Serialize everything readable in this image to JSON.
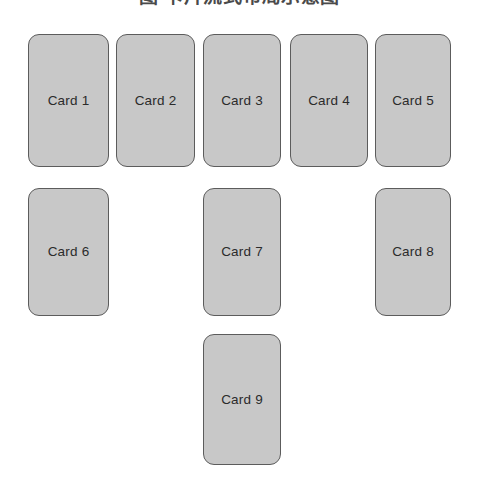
{
  "page": {
    "width": 479,
    "height": 495,
    "background_color": "#ffffff"
  },
  "heading": {
    "text": "图 卡片流式布局示意图",
    "clipped": true,
    "color": "#4a4a4a"
  },
  "style": {
    "card_fill": "#c8c8c8",
    "card_border": "#5c5c5c",
    "card_text": "#2b2b2b",
    "corner_radius_px": 11
  },
  "grid": {
    "columns": 5,
    "rows": 3,
    "card_width": 81,
    "card_height": 133,
    "column_x": [
      28,
      116,
      203,
      290,
      375
    ],
    "row_y": [
      34,
      188,
      334
    ],
    "row_heights": [
      133,
      128,
      131
    ]
  },
  "cards": [
    {
      "label": "Card 1",
      "row": 0,
      "col": 0,
      "x": 28,
      "y": 34,
      "w": 81,
      "h": 133
    },
    {
      "label": "Card 2",
      "row": 0,
      "col": 1,
      "x": 116,
      "y": 34,
      "w": 79,
      "h": 133
    },
    {
      "label": "Card 3",
      "row": 0,
      "col": 2,
      "x": 203,
      "y": 34,
      "w": 78,
      "h": 133
    },
    {
      "label": "Card 4",
      "row": 0,
      "col": 3,
      "x": 290,
      "y": 34,
      "w": 78,
      "h": 133
    },
    {
      "label": "Card 5",
      "row": 0,
      "col": 4,
      "x": 375,
      "y": 34,
      "w": 76,
      "h": 133
    },
    {
      "label": "Card 6",
      "row": 1,
      "col": 0,
      "x": 28,
      "y": 188,
      "w": 81,
      "h": 128
    },
    {
      "label": "Card 7",
      "row": 1,
      "col": 2,
      "x": 203,
      "y": 188,
      "w": 78,
      "h": 128
    },
    {
      "label": "Card 8",
      "row": 1,
      "col": 4,
      "x": 375,
      "y": 188,
      "w": 76,
      "h": 128
    },
    {
      "label": "Card 9",
      "row": 2,
      "col": 2,
      "x": 203,
      "y": 334,
      "w": 78,
      "h": 131
    }
  ]
}
